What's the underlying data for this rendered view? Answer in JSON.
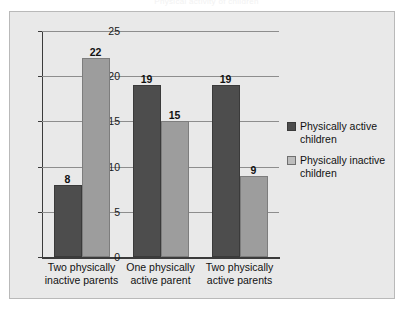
{
  "chart_data": {
    "type": "bar",
    "title": "Physical activity of children",
    "categories": [
      "Two physically inactive parents",
      "One physically active parent",
      "Two physically active parents"
    ],
    "category_lines": [
      [
        "Two physically",
        "inactive parents"
      ],
      [
        "One physically",
        "active parent"
      ],
      [
        "Two physically",
        "active parents"
      ]
    ],
    "series": [
      {
        "name": "Physically active children",
        "values": [
          8,
          19,
          19
        ],
        "color": "#4d4d4d"
      },
      {
        "name": "Physically inactive children",
        "values": [
          22,
          15,
          9
        ],
        "color": "#9d9d9d"
      }
    ],
    "xlabel": "",
    "ylabel": "",
    "ylim": [
      0,
      25
    ],
    "yticks": [
      0,
      5,
      10,
      15,
      20,
      25
    ],
    "grid": true,
    "legend_position": "right",
    "data_labels": true
  },
  "legend": {
    "items": [
      {
        "label_line1": "Physically active",
        "label_line2": "children"
      },
      {
        "label_line1": "Physically inactive",
        "label_line2": "children"
      }
    ]
  },
  "colors": {
    "bar_active": "#4d4d4d",
    "bar_inactive": "#9d9d9d",
    "panel_background": "#e9e9e9",
    "axis": "#3b3b3b",
    "gridline": "#8d8d8d"
  }
}
